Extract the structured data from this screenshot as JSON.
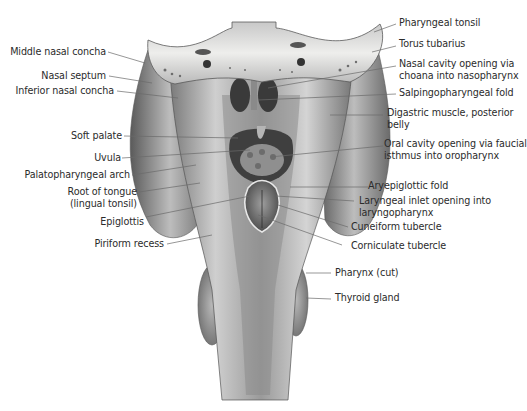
{
  "figure": {
    "colors": {
      "background": "#ffffff",
      "label_text": "#2b2b2b",
      "leader_line": "#6a6a6a",
      "tissue_light": "#d9d9d9",
      "tissue_mid": "#a9a9a9",
      "tissue_dark": "#4a4a4a",
      "bone": "#e4e2dc"
    }
  },
  "labels_left": [
    {
      "id": "middle-nasal-concha",
      "line1": "Middle nasal concha"
    },
    {
      "id": "nasal-septum",
      "line1": "Nasal septum"
    },
    {
      "id": "inferior-nasal-concha",
      "line1": "Inferior nasal concha"
    },
    {
      "id": "soft-palate",
      "line1": "Soft palate"
    },
    {
      "id": "uvula",
      "line1": "Uvula"
    },
    {
      "id": "palatopharyngeal-arch",
      "line1": "Palatopharyngeal arch"
    },
    {
      "id": "root-of-tongue",
      "line1": "Root of tongue",
      "line2": "(lingual tonsil)"
    },
    {
      "id": "epiglottis",
      "line1": "Epiglottis"
    },
    {
      "id": "piriform-recess",
      "line1": "Piriform recess"
    }
  ],
  "labels_right": [
    {
      "id": "pharyngeal-tonsil",
      "line1": "Pharyngeal tonsil"
    },
    {
      "id": "torus-tubarius",
      "line1": "Torus tubarius"
    },
    {
      "id": "nasal-cavity-opening",
      "line1": "Nasal cavity opening via",
      "line2": "choana into nasopharynx"
    },
    {
      "id": "salpingopharyngeal-fold",
      "line1": "Salpingopharyngeal fold"
    },
    {
      "id": "digastric-muscle",
      "line1": "Digastric muscle, posterior",
      "line2": "belly"
    },
    {
      "id": "oral-cavity-opening",
      "line1": "Oral cavity opening via faucial",
      "line2": "isthmus into oropharynx"
    },
    {
      "id": "aryepiglottic-fold",
      "line1": "Aryepiglottic fold"
    },
    {
      "id": "laryngeal-inlet",
      "line1": "Laryngeal inlet opening into",
      "line2": "laryngopharynx"
    },
    {
      "id": "cuneiform-tubercle",
      "line1": "Cuneiform tubercle"
    },
    {
      "id": "corniculate-tubercle",
      "line1": "Corniculate tubercle"
    },
    {
      "id": "pharynx-cut",
      "line1": "Pharynx (cut)"
    },
    {
      "id": "thyroid-gland",
      "line1": "Thyroid gland"
    }
  ]
}
